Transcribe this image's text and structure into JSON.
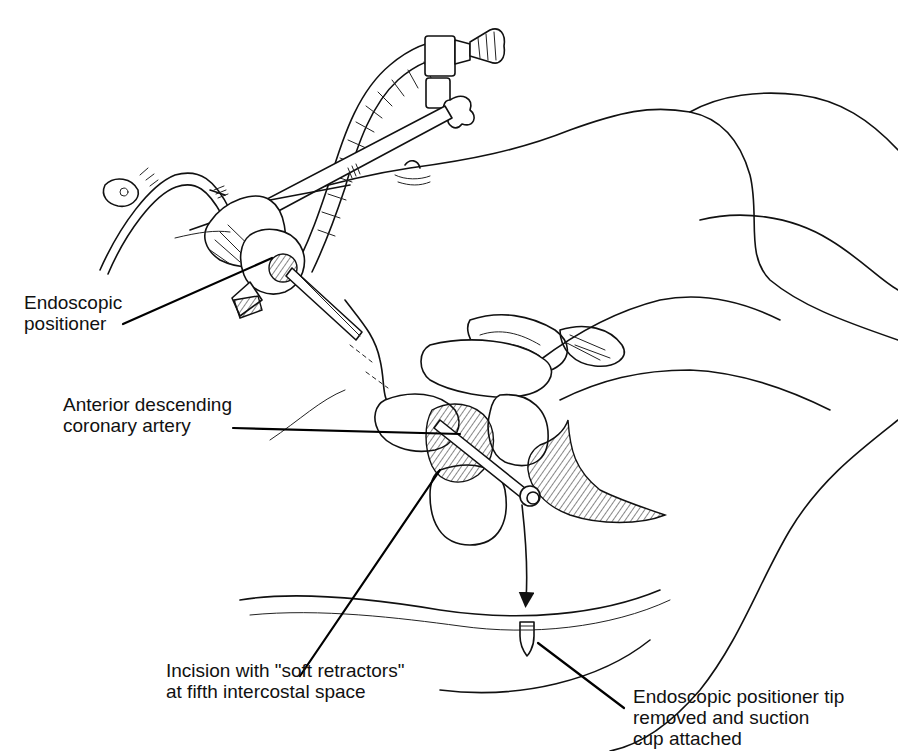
{
  "figure": {
    "type": "surgical illustration",
    "background": "#ffffff",
    "ink_color": "#111111"
  },
  "labels": [
    {
      "id": "endoscopic-positioner",
      "lines": [
        "Endoscopic",
        "positioner"
      ]
    },
    {
      "id": "anterior-descending-coronary-artery",
      "lines": [
        "Anterior descending",
        "coronary artery"
      ]
    },
    {
      "id": "incision",
      "lines": [
        "Incision with \"soft retractors\"",
        "at fifth intercostal space"
      ]
    },
    {
      "id": "positioner-tip",
      "lines": [
        "Endoscopic positioner tip",
        "removed and suction",
        "cup attached"
      ]
    }
  ]
}
